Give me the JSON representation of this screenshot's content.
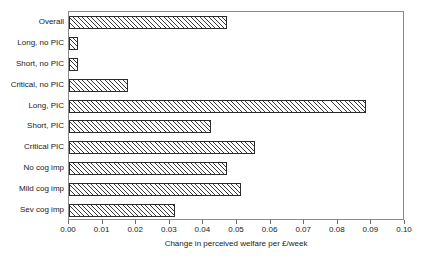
{
  "chart_data": {
    "type": "bar",
    "orientation": "horizontal",
    "title": "",
    "xlabel": "Change in perceived welfare per £/week",
    "ylabel": "",
    "xlim": [
      0.0,
      0.1
    ],
    "xticks": [
      "0.00",
      "0.01",
      "0.02",
      "0.03",
      "0.04",
      "0.05",
      "0.06",
      "0.07",
      "0.08",
      "0.09",
      "0.10"
    ],
    "xtick_values": [
      0.0,
      0.01,
      0.02,
      0.03,
      0.04,
      0.05,
      0.06,
      0.07,
      0.08,
      0.09,
      0.1
    ],
    "grid": false,
    "legend": "none",
    "bar_fill": "diagonal-hatch",
    "bar_edge_color": "#2b2b2b",
    "categories": [
      "Overall",
      "Long, no PIC",
      "Short, no PIC",
      "Critical, no PIC",
      "Long, PIC",
      "Short, PIC",
      "Critical PIC",
      "No cog imp",
      "Mild cog imp",
      "Sev cog imp"
    ],
    "values": [
      0.047,
      0.0027,
      0.0027,
      0.0176,
      0.0884,
      0.0423,
      0.0553,
      0.047,
      0.0512,
      0.0315
    ]
  }
}
